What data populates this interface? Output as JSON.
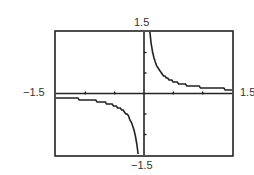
{
  "chart_data": {
    "type": "line",
    "title": "",
    "xlabel": "",
    "ylabel": "",
    "function": "y = k/x (k ≈ 0.15)",
    "xlim": [
      -1.5,
      1.5
    ],
    "ylim": [
      -1.5,
      1.5
    ],
    "grid": false,
    "legend": null,
    "tick_labels": {
      "xmin": "−1.5",
      "xmax": "1.5",
      "ymin": "−1.5",
      "ymax": "1.5"
    },
    "x_ticks": [
      -1.0,
      -0.5,
      0.5,
      1.0
    ],
    "y_ticks": [
      -1.0,
      -0.5,
      0.5,
      1.0
    ],
    "series": [
      {
        "name": "left branch",
        "x": [
          -1.5,
          -1.25,
          -1.0,
          -0.75,
          -0.5,
          -0.4,
          -0.3,
          -0.25,
          -0.2,
          -0.15,
          -0.125,
          -0.1
        ],
        "y": [
          -0.1,
          -0.12,
          -0.15,
          -0.2,
          -0.3,
          -0.375,
          -0.5,
          -0.6,
          -0.75,
          -1.0,
          -1.2,
          -1.5
        ]
      },
      {
        "name": "right branch",
        "x": [
          0.1,
          0.125,
          0.15,
          0.2,
          0.25,
          0.3,
          0.4,
          0.5,
          0.75,
          1.0,
          1.25,
          1.5
        ],
        "y": [
          1.5,
          1.2,
          1.0,
          0.75,
          0.6,
          0.5,
          0.375,
          0.3,
          0.2,
          0.15,
          0.12,
          0.1
        ]
      }
    ]
  },
  "labels": {
    "top": "1.5",
    "bottom": "−1.5",
    "left": "−1.5",
    "right": "1.5"
  }
}
